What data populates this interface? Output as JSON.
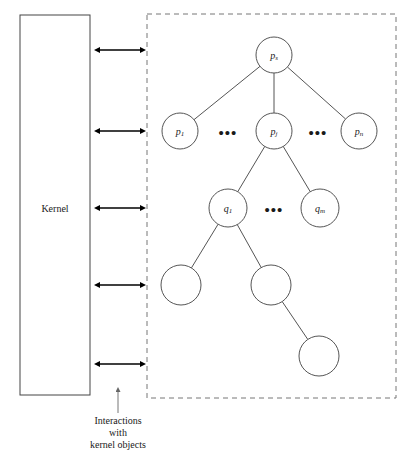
{
  "figure": {
    "kernel_box": {
      "label": "Kernel",
      "x": 20,
      "y": 15,
      "width": 70,
      "height": 380
    },
    "user_region": {
      "x": 147,
      "y": 14,
      "width": 249,
      "height": 384,
      "border_style": "dashed"
    },
    "caption": {
      "line1": "Interactions",
      "line2": "with",
      "line3": "kernel objects"
    },
    "arrows": {
      "name": "bidirectional-interaction-arrow",
      "x_start": 100,
      "x_end": 140,
      "y_positions": [
        50,
        131,
        208,
        285,
        364
      ]
    },
    "colors": {
      "node_stroke": "#555555",
      "box_stroke": "#444444",
      "dashed_stroke": "#777777",
      "arrow": "#000000",
      "text": "#1a1a1a",
      "background": "#ffffff"
    },
    "nodes": [
      {
        "id": "ps",
        "base": "p",
        "sub": "s",
        "cx": 274,
        "cy": 55,
        "r": 18
      },
      {
        "id": "p1",
        "base": "p",
        "sub": "1",
        "cx": 180,
        "cy": 131,
        "r": 18
      },
      {
        "id": "pj",
        "base": "p",
        "sub": "j",
        "cx": 274,
        "cy": 131,
        "r": 18
      },
      {
        "id": "pn",
        "base": "p",
        "sub": "n",
        "cx": 359,
        "cy": 131,
        "r": 18
      },
      {
        "id": "q1",
        "base": "q",
        "sub": "1",
        "cx": 228,
        "cy": 208,
        "r": 19
      },
      {
        "id": "qm",
        "base": "q",
        "sub": "m",
        "cx": 320,
        "cy": 208,
        "r": 19
      },
      {
        "id": "leaf1",
        "base": "",
        "sub": "",
        "cx": 181,
        "cy": 285,
        "r": 20
      },
      {
        "id": "leaf2",
        "base": "",
        "sub": "",
        "cx": 271,
        "cy": 285,
        "r": 20
      },
      {
        "id": "leaf3",
        "base": "",
        "sub": "",
        "cx": 319,
        "cy": 356,
        "r": 20
      }
    ],
    "edges": [
      {
        "from": "ps",
        "to": "p1"
      },
      {
        "from": "ps",
        "to": "pj"
      },
      {
        "from": "ps",
        "to": "pn"
      },
      {
        "from": "pj",
        "to": "q1"
      },
      {
        "from": "pj",
        "to": "qm"
      },
      {
        "from": "q1",
        "to": "leaf1"
      },
      {
        "from": "q1",
        "to": "leaf2"
      },
      {
        "from": "leaf2",
        "to": "leaf3"
      }
    ],
    "ellipses": [
      {
        "name": "ellipsis-between-p1-pj",
        "cx": 228,
        "cy": 133,
        "text": "•••"
      },
      {
        "name": "ellipsis-between-pj-pn",
        "cx": 318,
        "cy": 133,
        "text": "•••"
      },
      {
        "name": "ellipsis-between-q1-qm",
        "cx": 274,
        "cy": 210,
        "text": "•••"
      }
    ]
  }
}
